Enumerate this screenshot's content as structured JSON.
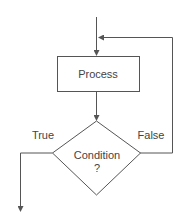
{
  "diagram": {
    "type": "flowchart",
    "nodes": [
      {
        "id": "process",
        "shape": "rectangle",
        "label": "Process"
      },
      {
        "id": "condition",
        "shape": "diamond",
        "label_line1": "Condition",
        "label_line2": "?"
      }
    ],
    "edges": [
      {
        "from": "entry",
        "to": "process"
      },
      {
        "from": "process",
        "to": "condition"
      },
      {
        "from": "condition",
        "to": "exit",
        "label": "True"
      },
      {
        "from": "condition",
        "to": "process",
        "label": "False"
      }
    ],
    "labels": {
      "process": "Process",
      "condition_line1": "Condition",
      "condition_line2": "?",
      "true_branch": "True",
      "false_branch": "False"
    },
    "colors": {
      "stroke": "#555555",
      "text": "#444444",
      "background": "#ffffff"
    }
  }
}
